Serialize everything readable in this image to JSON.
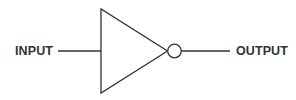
{
  "diagram": {
    "type": "logic-gate",
    "gate": "NOT",
    "input_label": "INPUT",
    "output_label": "OUTPUT",
    "stroke_color": "#333333",
    "background_color": "#ffffff"
  }
}
